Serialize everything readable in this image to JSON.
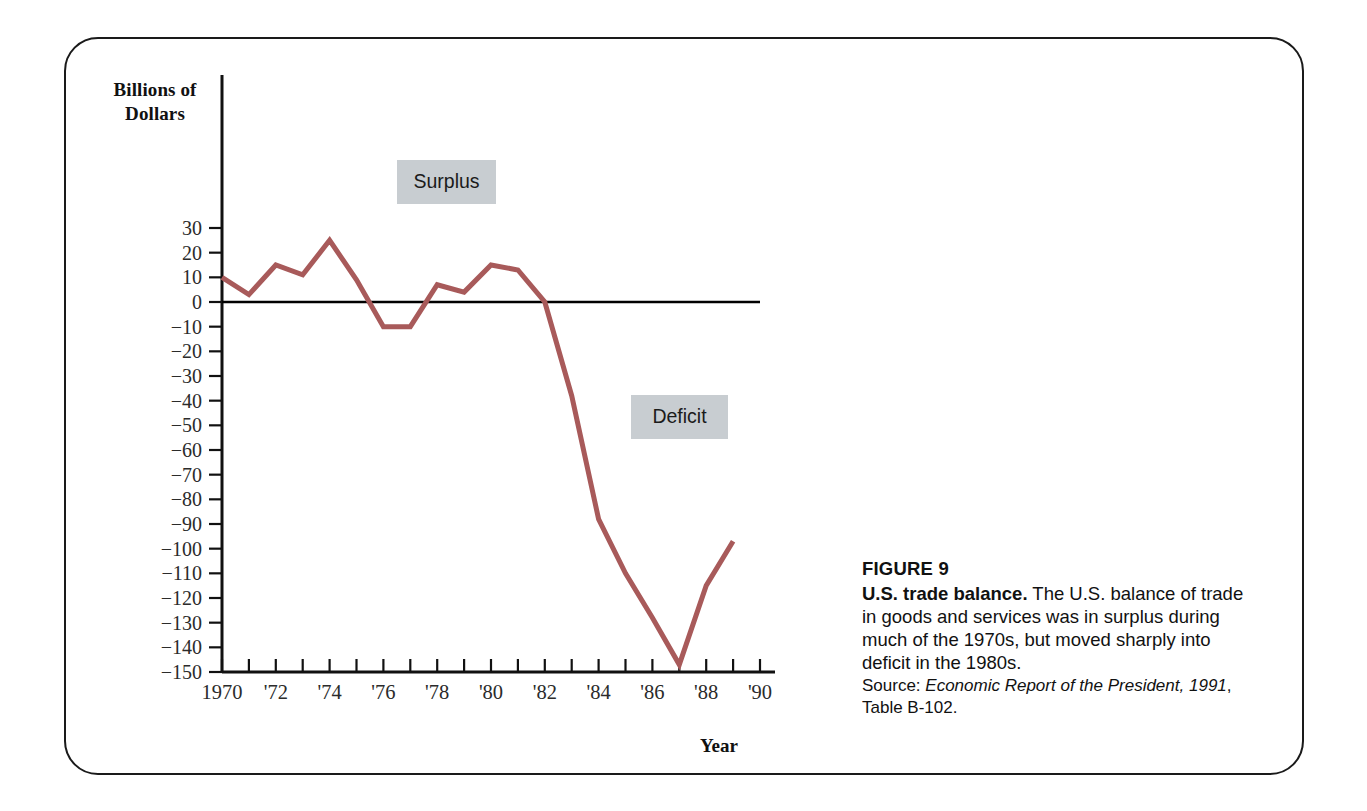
{
  "figure": {
    "frame_border_color": "#1a1a1a",
    "background_color": "#ffffff"
  },
  "axes": {
    "y_title_line1": "Billions of",
    "y_title_line2": "Dollars",
    "x_title": "Year"
  },
  "annotations": {
    "surplus_label": "Surplus",
    "deficit_label": "Deficit",
    "chip_background": "#c8cdd1"
  },
  "caption": {
    "figure_number": "FIGURE 9",
    "lead": "U.S. trade balance.",
    "body": " The U.S. balance of trade in goods and services was in surplus during much of the 1970s, but moved sharply into deficit in the 1980s.",
    "source_prefix": "Source: ",
    "source_italic_1": "Economic Report of the President,",
    "source_italic_2": "1991",
    "source_suffix": ", Table B-102."
  },
  "chart_data": {
    "type": "line",
    "title": "U.S. trade balance",
    "xlabel": "Year",
    "ylabel": "Billions of Dollars",
    "line_color": "#a85a5a",
    "line_width": 5,
    "zero_line_color": "#000000",
    "grid": false,
    "legend": null,
    "xlim": [
      1970,
      1990
    ],
    "ylim": [
      -150,
      30
    ],
    "y_ticks": [
      30,
      20,
      10,
      0,
      -10,
      -20,
      -30,
      -40,
      -50,
      -60,
      -70,
      -80,
      -90,
      -100,
      -110,
      -120,
      -130,
      -140,
      -150
    ],
    "y_tick_labels": [
      "30",
      "20",
      "10",
      "0",
      "−10",
      "−20",
      "−30",
      "−40",
      "−50",
      "−60",
      "−70",
      "−80",
      "−90",
      "−100",
      "−110",
      "−120",
      "−130",
      "−140",
      "−150"
    ],
    "x_ticks": [
      1970,
      1971,
      1972,
      1973,
      1974,
      1975,
      1976,
      1977,
      1978,
      1979,
      1980,
      1981,
      1982,
      1983,
      1984,
      1985,
      1986,
      1987,
      1988,
      1989,
      1990
    ],
    "x_tick_labels_shown": [
      "1970",
      "'72",
      "'74",
      "'76",
      "'78",
      "'80",
      "'82",
      "'84",
      "'86",
      "'88",
      "'90"
    ],
    "x_labeled_years": [
      1970,
      1972,
      1974,
      1976,
      1978,
      1980,
      1982,
      1984,
      1986,
      1988,
      1990
    ],
    "x": [
      1970,
      1971,
      1972,
      1973,
      1974,
      1975,
      1976,
      1977,
      1978,
      1979,
      1980,
      1981,
      1982,
      1983,
      1984,
      1985,
      1986,
      1987,
      1988,
      1989
    ],
    "values": [
      10,
      3,
      15,
      11,
      25,
      9,
      -10,
      -10,
      7,
      4,
      15,
      13,
      0,
      -38,
      -88,
      -110,
      -128,
      -147,
      -115,
      -97
    ],
    "series": [
      {
        "name": "U.S. trade balance",
        "values": [
          10,
          3,
          15,
          11,
          25,
          9,
          -10,
          -10,
          7,
          4,
          15,
          13,
          0,
          -38,
          -88,
          -110,
          -128,
          -147,
          -115,
          -97
        ]
      }
    ],
    "annotations": [
      {
        "text": "Surplus",
        "x": 1976,
        "y": 45
      },
      {
        "text": "Deficit",
        "x": 1985,
        "y": -45
      }
    ]
  }
}
